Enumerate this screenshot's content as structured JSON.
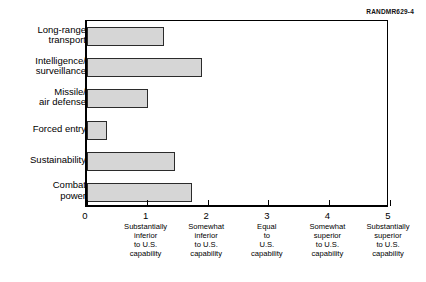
{
  "figure_id": "RANDMR629-4",
  "chart_data": {
    "type": "bar",
    "orientation": "horizontal",
    "title": "",
    "subtitle": "",
    "xlabel": "",
    "ylabel": "",
    "xlim": [
      0,
      5
    ],
    "grid": false,
    "legend": null,
    "categories": [
      "Long-range\ntransport",
      "Intelligence/\nsurveillance",
      "Missile/\nair defense",
      "Forced entry",
      "Sustainability",
      "Combat\npower"
    ],
    "values": [
      1.27,
      1.9,
      1.0,
      0.33,
      1.45,
      1.73
    ],
    "xticks": [
      0,
      1,
      2,
      3,
      4,
      5
    ],
    "xtick_labels": [
      "0",
      "1",
      "2",
      "3",
      "4",
      "5"
    ],
    "xtick_captions": [
      "",
      "Substantially\ninferior\nto U.S.\ncapability",
      "Somewhat\ninferior\nto U.S.\ncapability",
      "Equal\nto\nU.S.\ncapability",
      "Somewhat\nsuperior\nto U.S.\ncapability",
      "Substantially\nsuperior\nto U.S.\ncapability"
    ],
    "bar_fill_color": "#d6d6d6",
    "bar_edge_color": "#2b2b2b",
    "axis_color": "#000000",
    "background_color": "#ffffff"
  }
}
